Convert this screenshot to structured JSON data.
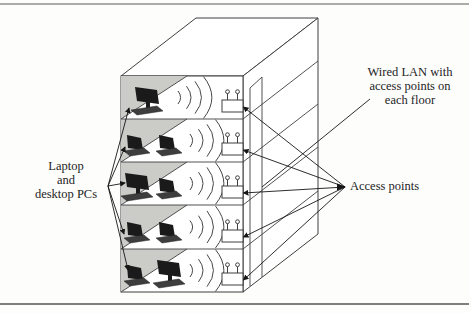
{
  "figure": {
    "type": "network-diagram"
  },
  "labels": {
    "devices": {
      "lines": [
        "Laptop",
        "and",
        "desktop PCs"
      ]
    },
    "wired_lan": {
      "lines": [
        "Wired LAN with",
        "access points on",
        "each floor"
      ]
    },
    "access_points": {
      "text": "Access points"
    }
  },
  "building": {
    "floor_count": 5,
    "floors": [
      {
        "name": "floor-1",
        "devices": [
          "desktop-pc"
        ],
        "access_point": true
      },
      {
        "name": "floor-2",
        "devices": [
          "laptop",
          "laptop"
        ],
        "access_point": true
      },
      {
        "name": "floor-3",
        "devices": [
          "desktop-pc",
          "laptop"
        ],
        "access_point": true
      },
      {
        "name": "floor-4",
        "devices": [
          "laptop",
          "laptop"
        ],
        "access_point": true
      },
      {
        "name": "floor-5",
        "devices": [
          "laptop",
          "desktop-pc"
        ],
        "access_point": true
      }
    ]
  },
  "icons": {
    "access_point": "access-point-icon",
    "wireless_waves": "wireless-signal-arc-icon",
    "desktop": "desktop-pc-icon",
    "laptop": "laptop-icon"
  },
  "colors": {
    "outline": "#3f3f3f",
    "shade": "#cbcbc7",
    "device": "#1a1a1a",
    "device_base": "#3d3d3d",
    "arrow": "#161616",
    "frame": "#8f8f8f",
    "text": "#242424",
    "background": "#fdfdfc"
  }
}
